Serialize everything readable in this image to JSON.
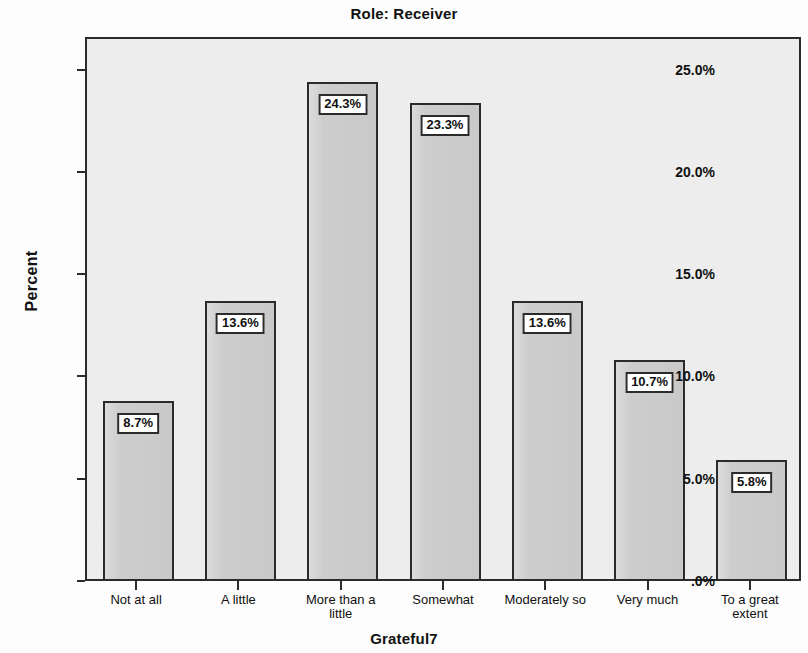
{
  "chart_data": {
    "type": "bar",
    "title": "Role: Receiver",
    "xlabel": "Grateful7",
    "ylabel": "Percent",
    "categories": [
      "Not at all",
      "A little",
      "More than a little",
      "Somewhat",
      "Moderately so",
      "Very much",
      "To a great extent"
    ],
    "category_lines": [
      [
        "Not at all"
      ],
      [
        "A little"
      ],
      [
        "More than a",
        "little"
      ],
      [
        "Somewhat"
      ],
      [
        "Moderately so"
      ],
      [
        "Very much"
      ],
      [
        "To a great",
        "extent"
      ]
    ],
    "values": [
      8.7,
      13.6,
      24.3,
      23.3,
      13.6,
      10.7,
      5.8
    ],
    "data_labels": [
      "8.7%",
      "13.6%",
      "24.3%",
      "23.3%",
      "13.6%",
      "10.7%",
      "5.8%"
    ],
    "ylim": [
      0,
      26.6
    ],
    "yticks": [
      0,
      5,
      10,
      15,
      20,
      25
    ],
    "ytick_labels": [
      ".0%",
      "5.0%",
      "10.0%",
      "15.0%",
      "20.0%",
      "25.0%"
    ],
    "grid": false,
    "legend": null,
    "bar_fill_color": "#cdcdcd",
    "bar_edge_color": "#2b2b2b",
    "panel_background": "#f0f0f0"
  }
}
